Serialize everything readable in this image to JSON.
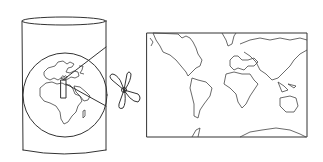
{
  "diagram": {
    "type": "cylindrical-map-projection-illustration",
    "elements": [
      {
        "name": "cylinder",
        "description": "Transparent cylinder wrapped around globe"
      },
      {
        "name": "globe",
        "description": "Globe showing Europe and Africa"
      },
      {
        "name": "light-source",
        "description": "Light source at globe center projecting rays"
      },
      {
        "name": "projection-rays",
        "description": "Lines projecting from center onto cylinder wall"
      },
      {
        "name": "scissors",
        "description": "Scissors indicating cutting the cylinder"
      },
      {
        "name": "flat-world-map",
        "description": "Resulting unrolled rectangular world map"
      }
    ],
    "colors": {
      "stroke": "#333333",
      "background": "#ffffff"
    }
  }
}
